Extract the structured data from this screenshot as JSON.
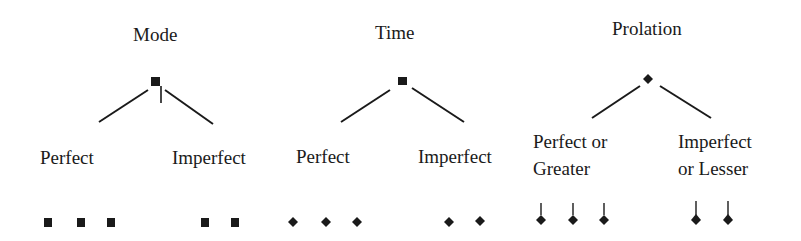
{
  "groups": [
    {
      "title": "Mode",
      "head_shape": "square-with-stem",
      "branches": [
        {
          "label_lines": [
            "Perfect"
          ],
          "note_shape": "square",
          "count": 3
        },
        {
          "label_lines": [
            "Imperfect"
          ],
          "note_shape": "square",
          "count": 2
        }
      ]
    },
    {
      "title": "Time",
      "head_shape": "square",
      "branches": [
        {
          "label_lines": [
            "Perfect"
          ],
          "note_shape": "diamond",
          "count": 3
        },
        {
          "label_lines": [
            "Imperfect"
          ],
          "note_shape": "diamond",
          "count": 2
        }
      ]
    },
    {
      "title": "Prolation",
      "head_shape": "diamond",
      "branches": [
        {
          "label_lines": [
            "Perfect or",
            "Greater"
          ],
          "note_shape": "stemmed-diamond",
          "count": 3
        },
        {
          "label_lines": [
            "Imperfect",
            "or Lesser"
          ],
          "note_shape": "stemmed-diamond",
          "count": 2
        }
      ]
    }
  ],
  "colors": {
    "ink": "#1a1a1a",
    "background": "#ffffff"
  }
}
